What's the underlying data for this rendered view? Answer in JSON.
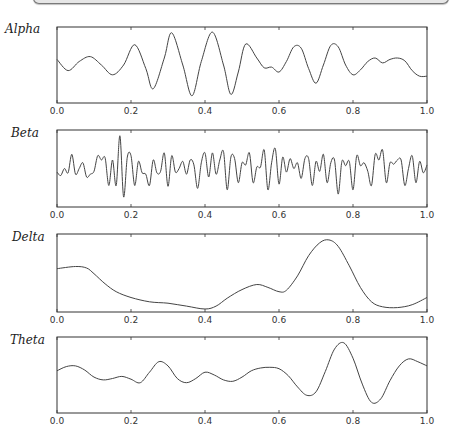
{
  "window": {
    "top_bar": ""
  },
  "chart_data": [
    {
      "type": "line",
      "title": "Alpha",
      "xlabel": "",
      "ylabel": "",
      "xlim": [
        0.0,
        1.0
      ],
      "xticks": [
        "0.0",
        "0.2",
        "0.4",
        "0.6",
        "0.8",
        "1.0"
      ],
      "grid": false,
      "x": [
        0.0,
        0.03,
        0.06,
        0.09,
        0.12,
        0.15,
        0.18,
        0.21,
        0.24,
        0.26,
        0.29,
        0.31,
        0.34,
        0.365,
        0.39,
        0.42,
        0.45,
        0.47,
        0.49,
        0.51,
        0.54,
        0.56,
        0.58,
        0.6,
        0.62,
        0.64,
        0.66,
        0.68,
        0.7,
        0.72,
        0.74,
        0.76,
        0.78,
        0.8,
        0.82,
        0.84,
        0.86,
        0.88,
        0.9,
        0.92,
        0.94,
        0.96,
        0.98,
        1.0
      ],
      "values": [
        0.58,
        0.42,
        0.55,
        0.62,
        0.5,
        0.36,
        0.5,
        0.79,
        0.45,
        0.16,
        0.6,
        0.96,
        0.5,
        0.06,
        0.55,
        0.97,
        0.5,
        0.08,
        0.4,
        0.8,
        0.6,
        0.46,
        0.47,
        0.4,
        0.55,
        0.76,
        0.74,
        0.45,
        0.24,
        0.5,
        0.78,
        0.76,
        0.5,
        0.36,
        0.43,
        0.55,
        0.6,
        0.53,
        0.58,
        0.6,
        0.56,
        0.42,
        0.34,
        0.34
      ]
    },
    {
      "type": "line",
      "title": "Beta",
      "xlabel": "",
      "ylabel": "",
      "xlim": [
        0.0,
        1.0
      ],
      "xticks": [
        "0.0",
        "0.2",
        "0.4",
        "0.6",
        "0.8",
        "1.0"
      ],
      "grid": false,
      "x": [
        0.0,
        0.01,
        0.02,
        0.03,
        0.04,
        0.05,
        0.06,
        0.07,
        0.08,
        0.09,
        0.1,
        0.11,
        0.12,
        0.13,
        0.14,
        0.15,
        0.16,
        0.17,
        0.18,
        0.19,
        0.2,
        0.21,
        0.22,
        0.23,
        0.24,
        0.25,
        0.26,
        0.27,
        0.28,
        0.29,
        0.3,
        0.31,
        0.32,
        0.33,
        0.34,
        0.35,
        0.36,
        0.37,
        0.38,
        0.39,
        0.4,
        0.41,
        0.42,
        0.43,
        0.44,
        0.45,
        0.46,
        0.47,
        0.48,
        0.49,
        0.5,
        0.51,
        0.52,
        0.53,
        0.54,
        0.55,
        0.56,
        0.57,
        0.58,
        0.59,
        0.6,
        0.61,
        0.62,
        0.63,
        0.64,
        0.65,
        0.66,
        0.67,
        0.68,
        0.69,
        0.7,
        0.71,
        0.72,
        0.73,
        0.74,
        0.75,
        0.76,
        0.77,
        0.78,
        0.79,
        0.8,
        0.81,
        0.82,
        0.83,
        0.84,
        0.85,
        0.86,
        0.87,
        0.88,
        0.89,
        0.9,
        0.91,
        0.92,
        0.93,
        0.94,
        0.95,
        0.96,
        0.97,
        0.98,
        0.99,
        1.0
      ],
      "values": [
        0.45,
        0.4,
        0.5,
        0.44,
        0.7,
        0.42,
        0.5,
        0.58,
        0.38,
        0.42,
        0.46,
        0.68,
        0.62,
        0.65,
        0.26,
        0.62,
        0.26,
        0.96,
        0.1,
        0.66,
        0.68,
        0.26,
        0.6,
        0.44,
        0.42,
        0.26,
        0.62,
        0.44,
        0.46,
        0.72,
        0.25,
        0.68,
        0.45,
        0.5,
        0.6,
        0.42,
        0.62,
        0.55,
        0.22,
        0.58,
        0.72,
        0.38,
        0.72,
        0.42,
        0.62,
        0.74,
        0.2,
        0.66,
        0.64,
        0.3,
        0.58,
        0.55,
        0.72,
        0.3,
        0.52,
        0.52,
        0.76,
        0.2,
        0.58,
        0.78,
        0.28,
        0.66,
        0.45,
        0.64,
        0.5,
        0.58,
        0.36,
        0.64,
        0.64,
        0.26,
        0.6,
        0.46,
        0.7,
        0.3,
        0.58,
        0.62,
        0.14,
        0.6,
        0.54,
        0.6,
        0.2,
        0.68,
        0.54,
        0.58,
        0.46,
        0.26,
        0.7,
        0.62,
        0.76,
        0.3,
        0.58,
        0.56,
        0.62,
        0.62,
        0.26,
        0.5,
        0.68,
        0.3,
        0.6,
        0.44,
        0.55
      ]
    },
    {
      "type": "line",
      "title": "Delta",
      "xlabel": "",
      "ylabel": "",
      "xlim": [
        0.0,
        1.0
      ],
      "xticks": [
        "0.0",
        "0.2",
        "0.4",
        "0.6",
        "0.8",
        "1.0"
      ],
      "grid": false,
      "x": [
        0.0,
        0.05,
        0.08,
        0.1,
        0.13,
        0.16,
        0.2,
        0.25,
        0.3,
        0.35,
        0.4,
        0.43,
        0.46,
        0.5,
        0.54,
        0.57,
        0.6,
        0.62,
        0.65,
        0.68,
        0.71,
        0.735,
        0.76,
        0.79,
        0.82,
        0.85,
        0.88,
        0.92,
        0.96,
        1.0
      ],
      "values": [
        0.56,
        0.59,
        0.57,
        0.49,
        0.35,
        0.24,
        0.16,
        0.1,
        0.08,
        0.04,
        0.0,
        0.04,
        0.15,
        0.27,
        0.34,
        0.3,
        0.24,
        0.26,
        0.46,
        0.74,
        0.92,
        0.96,
        0.87,
        0.6,
        0.3,
        0.1,
        0.03,
        0.02,
        0.06,
        0.16
      ]
    },
    {
      "type": "line",
      "title": "Theta",
      "xlabel": "",
      "ylabel": "",
      "xlim": [
        0.0,
        1.0
      ],
      "xticks": [
        "0.0",
        "0.2",
        "0.4",
        "0.6",
        "0.8",
        "1.0"
      ],
      "grid": false,
      "x": [
        0.0,
        0.025,
        0.05,
        0.075,
        0.1,
        0.125,
        0.15,
        0.175,
        0.2,
        0.225,
        0.25,
        0.275,
        0.3,
        0.325,
        0.35,
        0.375,
        0.4,
        0.425,
        0.45,
        0.475,
        0.5,
        0.525,
        0.55,
        0.575,
        0.6,
        0.625,
        0.65,
        0.675,
        0.7,
        0.725,
        0.75,
        0.775,
        0.8,
        0.825,
        0.85,
        0.875,
        0.9,
        0.925,
        0.95,
        0.975,
        1.0
      ],
      "values": [
        0.56,
        0.62,
        0.63,
        0.57,
        0.47,
        0.43,
        0.45,
        0.48,
        0.44,
        0.39,
        0.54,
        0.69,
        0.63,
        0.45,
        0.39,
        0.45,
        0.54,
        0.5,
        0.43,
        0.41,
        0.47,
        0.56,
        0.6,
        0.61,
        0.59,
        0.49,
        0.33,
        0.21,
        0.26,
        0.55,
        0.87,
        0.96,
        0.74,
        0.37,
        0.11,
        0.16,
        0.42,
        0.63,
        0.73,
        0.69,
        0.63
      ]
    }
  ]
}
